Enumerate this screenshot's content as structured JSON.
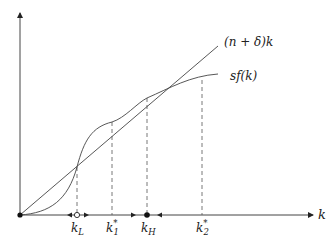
{
  "diagram": {
    "type": "solow-growth-multiple-equilibria",
    "axes": {
      "x_label": "k",
      "y_label": ""
    },
    "curves": {
      "line_label": "(n + δ)k",
      "curve_label": "sf(k)"
    },
    "points": [
      {
        "id": "kL",
        "label_base": "k",
        "label_sub": "L",
        "label_sup": "",
        "marker": "open-circle",
        "stability": "unstable"
      },
      {
        "id": "k1",
        "label_base": "k",
        "label_sub": "1",
        "label_sup": "*",
        "marker": "none"
      },
      {
        "id": "kH",
        "label_base": "k",
        "label_sub": "H",
        "label_sup": "",
        "marker": "filled-circle",
        "stability": "stable"
      },
      {
        "id": "k2",
        "label_base": "k",
        "label_sub": "2",
        "label_sup": "*",
        "marker": "none"
      }
    ],
    "colors": {
      "stroke": "#444444",
      "dash": "#555555",
      "marker": "#111111"
    }
  }
}
